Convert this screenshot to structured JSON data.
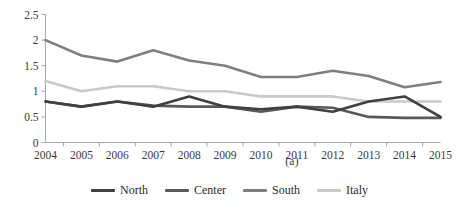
{
  "chart_data": {
    "type": "line",
    "title": "",
    "subtitle": "",
    "caption": "(a)",
    "xlabel": "",
    "ylabel": "",
    "categories": [
      "2004",
      "2005",
      "2006",
      "2007",
      "2008",
      "2009",
      "2010",
      "2011",
      "2012",
      "2013",
      "2014",
      "2015"
    ],
    "x": [
      2004,
      2005,
      2006,
      2007,
      2008,
      2009,
      2010,
      2011,
      2012,
      2013,
      2014,
      2015
    ],
    "ylim": [
      0,
      2.5
    ],
    "yticks": [
      0,
      0.5,
      1,
      1.5,
      2,
      2.5
    ],
    "ytick_labels": [
      "0",
      "0.5",
      "1",
      "1.5",
      "2",
      "2.5"
    ],
    "grid": false,
    "legend_position": "bottom-center",
    "series": [
      {
        "name": "North",
        "color": "#404040",
        "values": [
          0.8,
          0.7,
          0.8,
          0.7,
          0.9,
          0.7,
          0.65,
          0.7,
          0.6,
          0.8,
          0.9,
          0.5
        ]
      },
      {
        "name": "Center",
        "color": "#595959",
        "values": [
          0.8,
          0.7,
          0.8,
          0.72,
          0.7,
          0.7,
          0.6,
          0.7,
          0.68,
          0.5,
          0.48,
          0.48
        ]
      },
      {
        "name": "South",
        "color": "#7f7f7f",
        "values": [
          2.0,
          1.7,
          1.58,
          1.8,
          1.6,
          1.5,
          1.28,
          1.28,
          1.4,
          1.3,
          1.08,
          1.18
        ]
      },
      {
        "name": "Italy",
        "color": "#c9c9c9",
        "values": [
          1.2,
          1.0,
          1.1,
          1.1,
          1.0,
          1.0,
          0.9,
          0.9,
          0.9,
          0.8,
          0.8,
          0.8
        ]
      }
    ]
  },
  "legend": {
    "items": [
      {
        "label": "North",
        "color": "#404040"
      },
      {
        "label": "Center",
        "color": "#595959"
      },
      {
        "label": "South",
        "color": "#7f7f7f"
      },
      {
        "label": "Italy",
        "color": "#c9c9c9"
      }
    ]
  },
  "axes": {
    "axis_color": "#a8a8a8"
  }
}
